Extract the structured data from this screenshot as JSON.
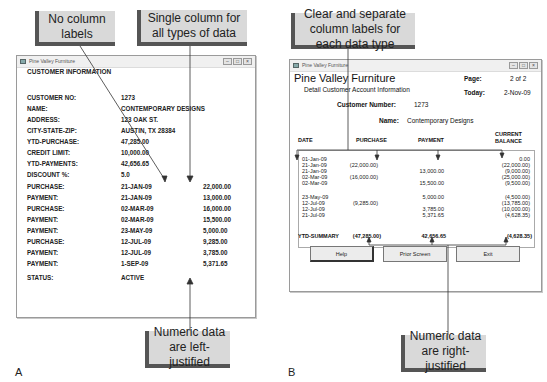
{
  "callouts": {
    "no_labels": "No column labels",
    "single_column": "Single column for all types of data",
    "left_justified": "Numeric data are left-justified",
    "clear_labels": "Clear and separate column labels for each data type",
    "right_justified": "Numeric data are right-justified"
  },
  "panel_letters": {
    "a": "A",
    "b": "B"
  },
  "window_a": {
    "title": "Pine Valley Furniture",
    "heading": "CUSTOMER INFORMATION",
    "rows": [
      {
        "label": "CUSTOMER NO:",
        "value": "1273",
        "amount": ""
      },
      {
        "label": "NAME:",
        "value": "CONTEMPORARY DESIGNS",
        "amount": ""
      },
      {
        "label": "ADDRESS:",
        "value": "123 OAK ST.",
        "amount": ""
      },
      {
        "label": "CITY-STATE-ZIP:",
        "value": "AUSTIN, TX 28384",
        "amount": ""
      },
      {
        "label": "YTD-PURCHASE:",
        "value": "47,285.00",
        "amount": ""
      },
      {
        "label": "CREDIT LIMIT:",
        "value": "10,000.00",
        "amount": ""
      },
      {
        "label": "YTD-PAYMENTS:",
        "value": "42,656.65",
        "amount": ""
      },
      {
        "label": "DISCOUNT %:",
        "value": "5.0",
        "amount": ""
      },
      {
        "label": "PURCHASE:",
        "value": "21-JAN-09",
        "amount": "22,000.00"
      },
      {
        "label": "PAYMENT:",
        "value": "21-JAN-09",
        "amount": "13,000.00"
      },
      {
        "label": "PURCHASE:",
        "value": "02-MAR-09",
        "amount": "16,000.00"
      },
      {
        "label": "PAYMENT:",
        "value": "02-MAR-09",
        "amount": "15,500.00"
      },
      {
        "label": "PAYMENT:",
        "value": "23-MAY-09",
        "amount": "5,000.00"
      },
      {
        "label": "PURCHASE:",
        "value": "12-JUL-09",
        "amount": "9,285.00"
      },
      {
        "label": "PAYMENT:",
        "value": "12-JUL-09",
        "amount": "3,785.00"
      },
      {
        "label": "PAYMENT:",
        "value": "1-SEP-09",
        "amount": "5,371.65"
      },
      {
        "label": "STATUS:",
        "value": "ACTIVE",
        "amount": ""
      }
    ]
  },
  "window_b": {
    "title": "Pine Valley Furniture",
    "company": "Pine Valley Furniture",
    "subtitle": "Detail Customer Account Information",
    "page_label": "Page:",
    "page_value": "2 of 2",
    "today_label": "Today:",
    "today_value": "2-Nov-09",
    "customer_number_label": "Customer Number:",
    "customer_number_value": "1273",
    "name_label": "Name:",
    "name_value": "Contemporary Designs",
    "columns": [
      "DATE",
      "PURCHASE",
      "PAYMENT",
      "CURRENT",
      "BALANCE"
    ],
    "rows": [
      {
        "date": "01-Jan-09",
        "purchase": "",
        "payment": "",
        "balance": "0.00"
      },
      {
        "date": "21-Jan-09",
        "purchase": "(22,000.00)",
        "payment": "",
        "balance": "(22,000.00)"
      },
      {
        "date": "21-Jan-09",
        "purchase": "",
        "payment": "13,000.00",
        "balance": "(9,000.00)"
      },
      {
        "date": "02-Mar-09",
        "purchase": "(16,000.00)",
        "payment": "",
        "balance": "(25,000.00)"
      },
      {
        "date": "02-Mar-09",
        "purchase": "",
        "payment": "15,500.00",
        "balance": "(9,500.00)"
      },
      {
        "date": "23-May-09",
        "purchase": "",
        "payment": "5,000.00",
        "balance": "(4,500.00)"
      },
      {
        "date": "12-Jul-09",
        "purchase": "(9,285.00)",
        "payment": "",
        "balance": "(13,785.00)"
      },
      {
        "date": "12-Jul-09",
        "purchase": "",
        "payment": "3,785.00",
        "balance": "(10,000.00)"
      },
      {
        "date": "21-Jul-09",
        "purchase": "",
        "payment": "5,371.65",
        "balance": "(4,628.35)"
      }
    ],
    "summary_label": "YTD-SUMMARY",
    "summary_purchase": "(47,285.00)",
    "summary_payment": "42,656.65",
    "summary_balance": "(4,628.35)",
    "buttons": {
      "help": "Help",
      "prior": "Prior Screen",
      "exit": "Exit"
    }
  }
}
